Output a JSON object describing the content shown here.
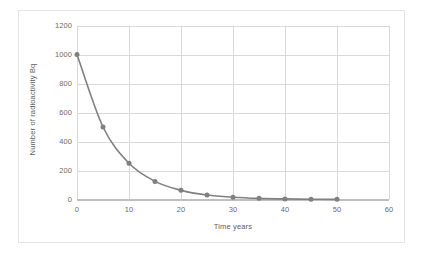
{
  "chart_data": {
    "type": "line",
    "title": "",
    "subtitle": "",
    "xlabel": "Time years",
    "ylabel": "Number of radioactivity Bq",
    "xlim": [
      0,
      60
    ],
    "ylim": [
      0,
      1200
    ],
    "x_ticks": [
      0,
      10,
      20,
      30,
      40,
      50,
      60
    ],
    "y_ticks": [
      0,
      200,
      400,
      600,
      800,
      1000,
      1200
    ],
    "x_tick_labels": [
      "0",
      "10",
      "20",
      "30",
      "40",
      "50",
      "60"
    ],
    "y_tick_labels": [
      "0",
      "200",
      "400",
      "600",
      "800",
      "1000",
      "1200"
    ],
    "grid": "horizontal-and-vertical",
    "legend": "none",
    "series": [
      {
        "name": "Radioactivity decay",
        "color": "#808080",
        "marker": "circle",
        "x": [
          0,
          5,
          10,
          15,
          20,
          25,
          30,
          35,
          40,
          45,
          50
        ],
        "values": [
          1000,
          500,
          250,
          125,
          63,
          31,
          16,
          8,
          4,
          2,
          1
        ]
      }
    ],
    "annotations": []
  },
  "style": {
    "plot_background": "#ffffff",
    "grid_color": "#d9d9d9",
    "axis_color": "#bfbfbf",
    "frame_color": "#e6e6e6",
    "text_color": "#6b6b6b",
    "series_color": "#808080"
  }
}
